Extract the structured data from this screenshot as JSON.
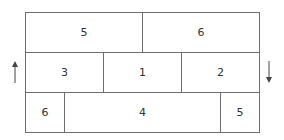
{
  "diagram": {
    "rows": [
      {
        "cells": [
          {
            "label": "5",
            "x": 25,
            "w": 118
          },
          {
            "label": "6",
            "x": 142,
            "w": 118
          }
        ]
      },
      {
        "cells": [
          {
            "label": "3",
            "x": 25,
            "w": 79
          },
          {
            "label": "1",
            "x": 103,
            "w": 79
          },
          {
            "label": "2",
            "x": 181,
            "w": 79
          }
        ]
      },
      {
        "cells": [
          {
            "label": "6",
            "x": 25,
            "w": 40
          },
          {
            "label": "4",
            "x": 64,
            "w": 157
          },
          {
            "label": "5",
            "x": 220,
            "w": 40
          }
        ]
      }
    ],
    "arrows": {
      "left": {
        "direction": "up",
        "icon": "arrow-up-icon"
      },
      "right": {
        "direction": "down",
        "icon": "arrow-down-icon"
      }
    },
    "line_color": "#6e6e6e"
  }
}
